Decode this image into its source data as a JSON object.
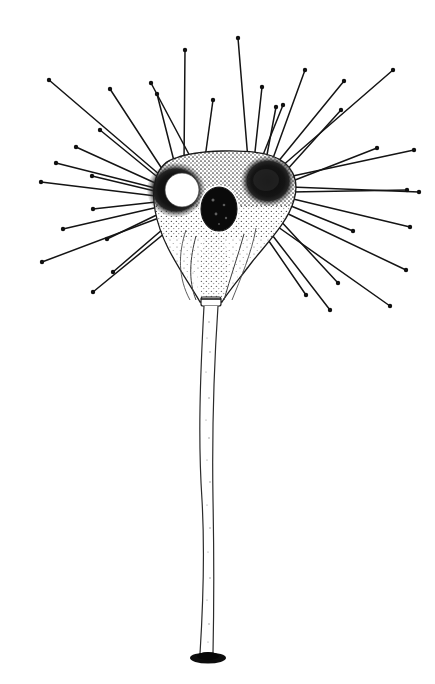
{
  "figure": {
    "medium": "ink line drawing with stipple shading",
    "background_color": "#ffffff",
    "ink_color": "#111111",
    "canvas": {
      "width": 435,
      "height": 684
    }
  },
  "parts": {
    "cell_body": {
      "name": "cell-body",
      "description": "bilobed heart/triangular shaped cell body with stippled cytoplasm",
      "center_x": 222,
      "center_y": 205,
      "fill": "#ffffff",
      "outline_color": "#1a1a1a"
    },
    "left_lobe": {
      "name": "left-lobe-hub",
      "center_x": 176,
      "center_y": 190,
      "radius": 28,
      "shade": "#151515"
    },
    "right_lobe": {
      "name": "right-lobe-hub",
      "center_x": 268,
      "center_y": 181,
      "radius": 26,
      "shade": "#151515"
    },
    "vacuole": {
      "name": "contractile-vacuole",
      "center_x": 182,
      "center_y": 190,
      "rx": 17,
      "ry": 17,
      "fill": "#ffffff"
    },
    "nucleus": {
      "name": "nucleus",
      "center_x": 219,
      "center_y": 209,
      "rx": 18,
      "ry": 22,
      "fill": "#080808",
      "rim": "#ffffff"
    },
    "stalk": {
      "name": "stalk",
      "top_y": 300,
      "bottom_y": 655,
      "top_width": 13,
      "bottom_width": 8,
      "wall_color": "#2b2b2b"
    },
    "basal_disc": {
      "name": "basal-attachment-disc",
      "center_x": 208,
      "center_y": 658,
      "rx": 17,
      "ry": 5,
      "fill": "#0d0d0d"
    },
    "neck": {
      "name": "stalk-neck-collar",
      "center_x": 211,
      "center_y": 300,
      "width": 16,
      "height": 12
    }
  },
  "axopodia": {
    "name": "axopodia-rays",
    "count": 34,
    "stroke_color": "#141414",
    "stroke_width": 1.5,
    "knob_radius": 2.2,
    "rays": [
      {
        "x1": 168,
        "y1": 178,
        "x2": 110,
        "y2": 89
      },
      {
        "x1": 167,
        "y1": 181,
        "x2": 49,
        "y2": 80
      },
      {
        "x1": 166,
        "y1": 184,
        "x2": 100,
        "y2": 130
      },
      {
        "x1": 164,
        "y1": 187,
        "x2": 76,
        "y2": 147
      },
      {
        "x1": 163,
        "y1": 190,
        "x2": 56,
        "y2": 163
      },
      {
        "x1": 163,
        "y1": 193,
        "x2": 92,
        "y2": 176
      },
      {
        "x1": 164,
        "y1": 197,
        "x2": 41,
        "y2": 182
      },
      {
        "x1": 165,
        "y1": 201,
        "x2": 93,
        "y2": 209
      },
      {
        "x1": 167,
        "y1": 205,
        "x2": 63,
        "y2": 229
      },
      {
        "x1": 169,
        "y1": 209,
        "x2": 107,
        "y2": 239
      },
      {
        "x1": 172,
        "y1": 213,
        "x2": 42,
        "y2": 262
      },
      {
        "x1": 177,
        "y1": 217,
        "x2": 113,
        "y2": 272
      },
      {
        "x1": 182,
        "y1": 219,
        "x2": 93,
        "y2": 292
      },
      {
        "x1": 175,
        "y1": 165,
        "x2": 157,
        "y2": 94
      },
      {
        "x1": 184,
        "y1": 162,
        "x2": 185,
        "y2": 50
      },
      {
        "x1": 192,
        "y1": 160,
        "x2": 151,
        "y2": 83
      },
      {
        "x1": 205,
        "y1": 158,
        "x2": 213,
        "y2": 100
      },
      {
        "x1": 248,
        "y1": 160,
        "x2": 238,
        "y2": 38
      },
      {
        "x1": 254,
        "y1": 161,
        "x2": 262,
        "y2": 87
      },
      {
        "x1": 261,
        "y1": 160,
        "x2": 283,
        "y2": 105
      },
      {
        "x1": 266,
        "y1": 160,
        "x2": 276,
        "y2": 107
      },
      {
        "x1": 272,
        "y1": 161,
        "x2": 305,
        "y2": 70
      },
      {
        "x1": 277,
        "y1": 163,
        "x2": 344,
        "y2": 81
      },
      {
        "x1": 281,
        "y1": 167,
        "x2": 393,
        "y2": 70
      },
      {
        "x1": 285,
        "y1": 172,
        "x2": 341,
        "y2": 110
      },
      {
        "x1": 288,
        "y1": 177,
        "x2": 414,
        "y2": 150
      },
      {
        "x1": 290,
        "y1": 182,
        "x2": 377,
        "y2": 148
      },
      {
        "x1": 291,
        "y1": 187,
        "x2": 419,
        "y2": 192
      },
      {
        "x1": 291,
        "y1": 192,
        "x2": 407,
        "y2": 190
      },
      {
        "x1": 289,
        "y1": 198,
        "x2": 410,
        "y2": 227
      },
      {
        "x1": 286,
        "y1": 204,
        "x2": 353,
        "y2": 231
      },
      {
        "x1": 282,
        "y1": 211,
        "x2": 406,
        "y2": 270
      },
      {
        "x1": 277,
        "y1": 217,
        "x2": 338,
        "y2": 283
      },
      {
        "x1": 271,
        "y1": 222,
        "x2": 390,
        "y2": 306
      },
      {
        "x1": 266,
        "y1": 227,
        "x2": 330,
        "y2": 310
      },
      {
        "x1": 262,
        "y1": 231,
        "x2": 306,
        "y2": 295
      }
    ]
  },
  "stipple": {
    "name": "cytoplasm-stipple",
    "dot_color": "#222222",
    "density_label": "dense near lobes, sparse in lower funnel"
  }
}
